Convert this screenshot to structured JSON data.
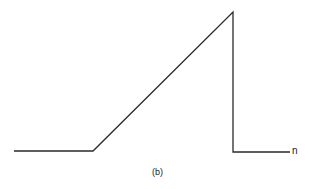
{
  "figure": {
    "caption": "(b)",
    "axis_label": "n",
    "stroke_color": "#2a2a2a",
    "waveform": {
      "description": "Sawtooth-like pulse: flat baseline, linear ramp up to a peak, sharp vertical drop back to baseline, then flat baseline continuing to the right",
      "points": [
        {
          "x": 14,
          "y": 151
        },
        {
          "x": 93,
          "y": 151
        },
        {
          "x": 233,
          "y": 12
        },
        {
          "x": 233,
          "y": 152
        },
        {
          "x": 290,
          "y": 152
        }
      ]
    }
  }
}
